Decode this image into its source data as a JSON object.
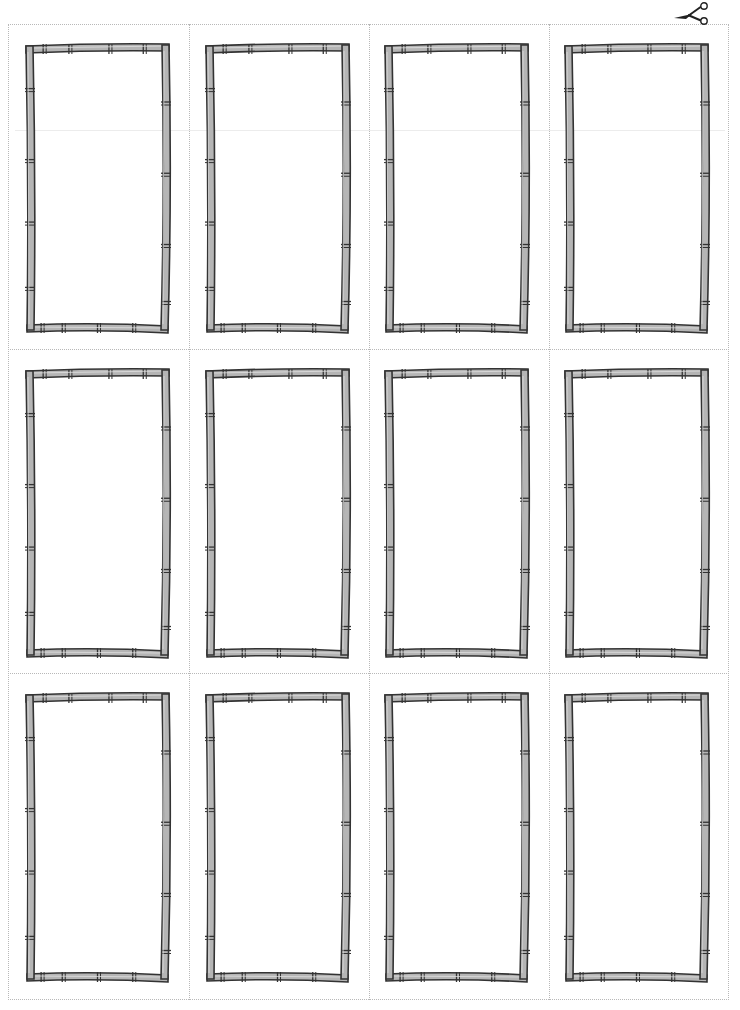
{
  "page": {
    "type": "printable-card-template",
    "columns": 4,
    "rows": 3,
    "card_count": 12,
    "cut_icon": "scissors-icon"
  },
  "colors": {
    "frame_fill": "#b5b5b5",
    "frame_stroke": "#333333",
    "cut_line": "#b8b8b8",
    "background": "#ffffff"
  },
  "cards": [
    {
      "row": 1,
      "col": 1,
      "label": ""
    },
    {
      "row": 1,
      "col": 2,
      "label": ""
    },
    {
      "row": 1,
      "col": 3,
      "label": ""
    },
    {
      "row": 1,
      "col": 4,
      "label": ""
    },
    {
      "row": 2,
      "col": 1,
      "label": ""
    },
    {
      "row": 2,
      "col": 2,
      "label": ""
    },
    {
      "row": 2,
      "col": 3,
      "label": ""
    },
    {
      "row": 2,
      "col": 4,
      "label": ""
    },
    {
      "row": 3,
      "col": 1,
      "label": ""
    },
    {
      "row": 3,
      "col": 2,
      "label": ""
    },
    {
      "row": 3,
      "col": 3,
      "label": ""
    },
    {
      "row": 3,
      "col": 4,
      "label": ""
    }
  ]
}
